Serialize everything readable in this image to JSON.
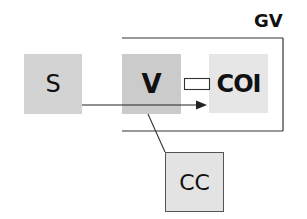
{
  "diagram": {
    "group": {
      "label": "GV"
    },
    "nodes": [
      {
        "id": "S",
        "label": "S",
        "color": "#d3d3d3"
      },
      {
        "id": "V",
        "label": "V",
        "color": "#cbcbcb"
      },
      {
        "id": "COI",
        "label": "COI",
        "color": "#e6e6e6"
      },
      {
        "id": "CC",
        "label": "CC",
        "color": "#e3e3e3"
      }
    ],
    "edges": [
      {
        "from": "S",
        "to": "COI",
        "type": "arrow"
      },
      {
        "from": "V",
        "to": "CC",
        "type": "line"
      },
      {
        "from": "V",
        "to": "COI",
        "type": "connector-rectangle"
      }
    ]
  }
}
